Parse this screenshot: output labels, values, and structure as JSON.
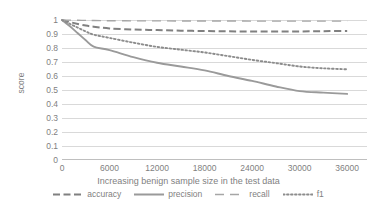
{
  "chart_data": {
    "type": "line",
    "title": "",
    "xlabel": "Increasing benign sample size in the test data",
    "ylabel": "score",
    "xlim": [
      0,
      38500
    ],
    "ylim": [
      0,
      1
    ],
    "xticks": [
      "0",
      "6000",
      "12000",
      "18000",
      "24000",
      "30000",
      "36000"
    ],
    "xtick_values": [
      0,
      6000,
      12000,
      18000,
      24000,
      30000,
      36000
    ],
    "yticks": [
      "0",
      "0.1",
      "0.2",
      "0.3",
      "0.4",
      "0.5",
      "0.6",
      "0.7",
      "0.8",
      "0.9",
      "1"
    ],
    "ytick_values": [
      0,
      0.1,
      0.2,
      0.3,
      0.4,
      0.5,
      0.6,
      0.7,
      0.8,
      0.9,
      1
    ],
    "grid": true,
    "legend_position": "bottom",
    "x": [
      0,
      1000,
      2000,
      3000,
      4000,
      6000,
      9000,
      12000,
      15000,
      18000,
      21000,
      24000,
      27000,
      30000,
      33000,
      36000
    ],
    "series": [
      {
        "name": "accuracy",
        "style": "dashed",
        "color": "#808080",
        "values": [
          1.0,
          0.985,
          0.972,
          0.96,
          0.952,
          0.94,
          0.932,
          0.928,
          0.924,
          0.921,
          0.919,
          0.918,
          0.917,
          0.918,
          0.92,
          0.922
        ]
      },
      {
        "name": "precision",
        "style": "solid",
        "color": "#9a9a9a",
        "values": [
          1.0,
          0.955,
          0.905,
          0.855,
          0.81,
          0.785,
          0.735,
          0.695,
          0.668,
          0.64,
          0.6,
          0.565,
          0.525,
          0.492,
          0.481,
          0.472
        ]
      },
      {
        "name": "recall",
        "style": "longdash",
        "color": "#a6a6a6",
        "values": [
          1.0,
          0.999,
          0.998,
          0.997,
          0.996,
          0.995,
          0.994,
          0.994,
          0.993,
          0.993,
          0.993,
          0.992,
          0.992,
          0.992,
          0.992,
          0.992
        ]
      },
      {
        "name": "f1",
        "style": "dotted",
        "color": "#8c8c8c",
        "values": [
          1.0,
          0.972,
          0.945,
          0.918,
          0.895,
          0.872,
          0.838,
          0.808,
          0.788,
          0.768,
          0.742,
          0.715,
          0.692,
          0.668,
          0.655,
          0.648
        ]
      }
    ]
  },
  "legend": {
    "items": [
      {
        "label": "accuracy"
      },
      {
        "label": "precision"
      },
      {
        "label": "recall"
      },
      {
        "label": "f1"
      }
    ]
  }
}
